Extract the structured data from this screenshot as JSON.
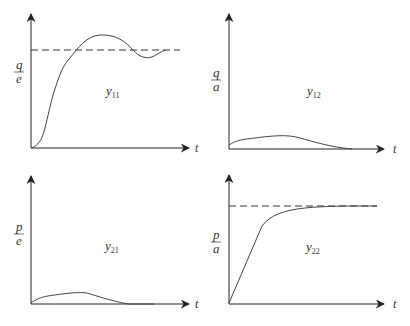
{
  "figure": {
    "panels": [
      {
        "id": "y11",
        "label_main": "y",
        "label_sub": "11",
        "ylabel_num": "q",
        "ylabel_den": "e",
        "xlabel": "t",
        "has_reference_line": true,
        "response": "underdamped overshoot then settles to reference"
      },
      {
        "id": "y12",
        "label_main": "y",
        "label_sub": "12",
        "ylabel_num": "q",
        "ylabel_den": "a",
        "xlabel": "t",
        "has_reference_line": false,
        "response": "small hump decaying to zero"
      },
      {
        "id": "y21",
        "label_main": "y",
        "label_sub": "21",
        "ylabel_num": "p",
        "ylabel_den": "e",
        "xlabel": "t",
        "has_reference_line": false,
        "response": "small hump decaying to zero"
      },
      {
        "id": "y22",
        "label_main": "y",
        "label_sub": "22",
        "ylabel_num": "p",
        "ylabel_den": "a",
        "xlabel": "t",
        "has_reference_line": true,
        "response": "first-order rise to reference"
      }
    ]
  },
  "colors": {
    "axis": "#222222",
    "curve": "#444444",
    "reference": "#333333",
    "background": "#ffffff"
  }
}
